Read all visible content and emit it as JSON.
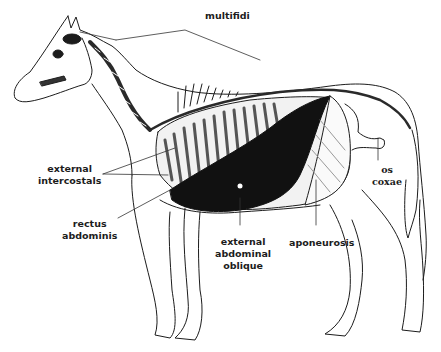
{
  "figure": {
    "colors": {
      "ink": "#1c1c1c",
      "muscle_dark": "#111111",
      "background": "#ffffff"
    }
  },
  "labels": {
    "multifidi": "multifidi",
    "external_intercostals": [
      "external",
      "intercostals"
    ],
    "rectus_abdominis": [
      "rectus",
      "abdominis"
    ],
    "external_abdominal_oblique": [
      "external",
      "abdominal",
      "oblique"
    ],
    "aponeurosis": "aponeurosis",
    "os_coxae": [
      "os",
      "coxae"
    ]
  }
}
